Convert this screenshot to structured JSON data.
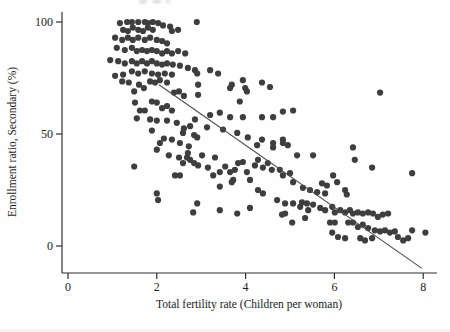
{
  "figure": {
    "background": "#fefefe",
    "top_edge_artifact": "faint-cropped-text-remnant"
  },
  "chart_data": {
    "type": "scatter",
    "title": "",
    "xlabel": "Total fertility rate (Children per woman)",
    "ylabel": "Enrollment ratio, Secondary (%)",
    "xlim": [
      0,
      8.3
    ],
    "ylim": [
      -12,
      104
    ],
    "xticks": [
      "0",
      "2",
      "4",
      "6",
      "8"
    ],
    "xtick_values": [
      0,
      2,
      4,
      6,
      8
    ],
    "yticks": [
      "0",
      "50",
      "100"
    ],
    "ytick_values": [
      0,
      50,
      100
    ],
    "grid": false,
    "legend": null,
    "point_color": "#3e3e3e",
    "axis_color": "#2f2f2f",
    "text_color": "#1c1c1c",
    "trend_line": {
      "x1": 2.05,
      "y1": 72,
      "x2": 7.97,
      "y2": -10,
      "color": "#4d4d4d",
      "slope": -14,
      "intercept": 100
    },
    "points": [
      [
        1.17,
        99.5
      ],
      [
        1.33,
        100
      ],
      [
        1.44,
        100
      ],
      [
        1.58,
        100
      ],
      [
        1.73,
        100
      ],
      [
        1.8,
        99.5
      ],
      [
        1.91,
        100
      ],
      [
        2.03,
        99.5
      ],
      [
        2.14,
        98.5
      ],
      [
        2.3,
        98
      ],
      [
        2.9,
        100
      ],
      [
        1.24,
        96.5
      ],
      [
        1.35,
        96
      ],
      [
        1.46,
        97.5
      ],
      [
        1.58,
        96.5
      ],
      [
        1.69,
        96
      ],
      [
        1.8,
        97.5
      ],
      [
        1.91,
        96.5
      ],
      [
        2.34,
        96
      ],
      [
        2.48,
        96.5
      ],
      [
        1.06,
        93
      ],
      [
        1.22,
        92
      ],
      [
        1.35,
        93
      ],
      [
        1.46,
        92
      ],
      [
        1.58,
        93
      ],
      [
        1.73,
        92
      ],
      [
        1.85,
        93
      ],
      [
        2.0,
        92
      ],
      [
        2.12,
        91.5
      ],
      [
        2.23,
        90.5
      ],
      [
        1.1,
        88.5
      ],
      [
        1.28,
        87.5
      ],
      [
        1.44,
        88.5
      ],
      [
        1.55,
        87
      ],
      [
        1.67,
        87.5
      ],
      [
        1.78,
        87
      ],
      [
        1.89,
        87.5
      ],
      [
        2.0,
        87
      ],
      [
        2.12,
        86
      ],
      [
        2.23,
        87
      ],
      [
        2.34,
        86
      ],
      [
        2.48,
        87
      ],
      [
        2.64,
        86
      ],
      [
        0.95,
        83
      ],
      [
        1.13,
        82.5
      ],
      [
        1.28,
        81.5
      ],
      [
        1.44,
        82.5
      ],
      [
        1.55,
        81.5
      ],
      [
        1.67,
        82.5
      ],
      [
        1.78,
        81.5
      ],
      [
        1.89,
        82.5
      ],
      [
        2.0,
        81.5
      ],
      [
        2.12,
        81
      ],
      [
        2.23,
        81.5
      ],
      [
        2.36,
        81
      ],
      [
        2.52,
        80.5
      ],
      [
        2.7,
        79.5
      ],
      [
        2.86,
        78.5
      ],
      [
        1.44,
        78
      ],
      [
        1.58,
        77
      ],
      [
        1.73,
        78
      ],
      [
        1.89,
        77
      ],
      [
        2.03,
        76.5
      ],
      [
        2.18,
        77
      ],
      [
        2.34,
        76.5
      ],
      [
        1.06,
        76
      ],
      [
        1.24,
        76.5
      ],
      [
        2.91,
        77
      ],
      [
        3.38,
        77
      ],
      [
        3.69,
        72
      ],
      [
        3.94,
        74
      ],
      [
        3.99,
        70.5
      ],
      [
        2.93,
        72
      ],
      [
        2.93,
        67.5
      ],
      [
        3.87,
        64.5
      ],
      [
        3.2,
        78.5
      ],
      [
        3.65,
        70.5
      ],
      [
        4.03,
        69
      ],
      [
        4.37,
        73
      ],
      [
        4.55,
        71
      ],
      [
        5.07,
        60.5
      ],
      [
        7.03,
        68.5
      ],
      [
        1.22,
        73.5
      ],
      [
        1.37,
        73
      ],
      [
        1.49,
        69
      ],
      [
        1.6,
        72
      ],
      [
        1.71,
        70.5
      ],
      [
        1.85,
        73.5
      ],
      [
        1.96,
        73
      ],
      [
        2.07,
        74
      ],
      [
        2.23,
        73
      ],
      [
        2.39,
        68.5
      ],
      [
        2.5,
        69
      ],
      [
        2.61,
        67
      ],
      [
        1.51,
        64
      ],
      [
        1.62,
        60.5
      ],
      [
        1.73,
        60.5
      ],
      [
        1.89,
        64.5
      ],
      [
        2.0,
        64
      ],
      [
        2.12,
        61.5
      ],
      [
        2.23,
        62.5
      ],
      [
        2.34,
        60.5
      ],
      [
        1.55,
        57
      ],
      [
        1.85,
        56.5
      ],
      [
        2.0,
        56
      ],
      [
        2.23,
        56
      ],
      [
        2.45,
        55
      ],
      [
        2.61,
        52.5
      ],
      [
        2.75,
        53.5
      ],
      [
        1.89,
        51.5
      ],
      [
        2.16,
        48
      ],
      [
        2.34,
        47.5
      ],
      [
        2.52,
        46
      ],
      [
        2.72,
        44.5
      ],
      [
        2.84,
        49.5
      ],
      [
        2.0,
        43
      ],
      [
        2.27,
        40.5
      ],
      [
        2.5,
        39.5
      ],
      [
        1.49,
        35.5
      ],
      [
        2.41,
        31.5
      ],
      [
        2.68,
        39.5
      ],
      [
        2.84,
        37
      ],
      [
        4.84,
        60
      ],
      [
        4.62,
        57.5
      ],
      [
        4.37,
        57.5
      ],
      [
        3.94,
        57.5
      ],
      [
        3.65,
        57.5
      ],
      [
        3.42,
        59.5
      ],
      [
        3.2,
        58.5
      ],
      [
        2.86,
        56.5
      ],
      [
        3.13,
        53
      ],
      [
        3.49,
        52
      ],
      [
        3.81,
        50.5
      ],
      [
        4.05,
        48.5
      ],
      [
        4.37,
        47.5
      ],
      [
        4.62,
        46
      ],
      [
        4.84,
        47.5
      ],
      [
        2.91,
        48.5
      ],
      [
        2.59,
        50.5
      ],
      [
        2.07,
        46
      ],
      [
        2.7,
        41.5
      ],
      [
        3.02,
        40.5
      ],
      [
        3.31,
        39.5
      ],
      [
        4.26,
        45
      ],
      [
        4.62,
        44
      ],
      [
        4.84,
        46
      ],
      [
        4.95,
        45
      ],
      [
        5.16,
        40.5
      ],
      [
        6.42,
        44
      ],
      [
        2.59,
        37
      ],
      [
        2.75,
        38.5
      ],
      [
        2.93,
        36
      ],
      [
        3.15,
        35
      ],
      [
        3.27,
        31.5
      ],
      [
        3.42,
        33
      ],
      [
        3.54,
        35.5
      ],
      [
        3.65,
        33
      ],
      [
        3.72,
        29.5
      ],
      [
        3.76,
        34
      ],
      [
        3.83,
        37
      ],
      [
        3.94,
        37.5
      ],
      [
        4.03,
        33
      ],
      [
        4.1,
        29.5
      ],
      [
        4.21,
        36
      ],
      [
        4.28,
        38.5
      ],
      [
        4.39,
        35
      ],
      [
        4.5,
        37
      ],
      [
        4.59,
        34
      ],
      [
        4.77,
        34
      ],
      [
        4.84,
        31.5
      ],
      [
        5.0,
        32.5
      ],
      [
        5.07,
        28.5
      ],
      [
        2.52,
        31.5
      ],
      [
        3.42,
        26.5
      ],
      [
        3.69,
        28.5
      ],
      [
        4.28,
        25
      ],
      [
        4.39,
        23.5
      ],
      [
        4.71,
        20.5
      ],
      [
        4.89,
        19
      ],
      [
        4.89,
        14.5
      ],
      [
        5.07,
        19
      ],
      [
        2.0,
        23.5
      ],
      [
        2.03,
        20.5
      ],
      [
        2.91,
        19
      ],
      [
        2.82,
        15
      ],
      [
        3.42,
        16
      ],
      [
        3.81,
        14.5
      ],
      [
        4.1,
        17
      ],
      [
        4.82,
        14
      ],
      [
        5.05,
        10.5
      ],
      [
        5.52,
        40.5
      ],
      [
        6.46,
        38.5
      ],
      [
        6.85,
        35
      ],
      [
        7.75,
        32.5
      ],
      [
        5.97,
        31.5
      ],
      [
        6.06,
        28.5
      ],
      [
        5.72,
        28
      ],
      [
        5.83,
        27
      ],
      [
        5.29,
        26
      ],
      [
        5.45,
        25
      ],
      [
        5.61,
        24
      ],
      [
        5.79,
        23.5
      ],
      [
        6.24,
        25
      ],
      [
        6.28,
        23
      ],
      [
        5.27,
        19.5
      ],
      [
        5.38,
        19
      ],
      [
        5.52,
        18.5
      ],
      [
        5.23,
        17.5
      ],
      [
        5.41,
        16
      ],
      [
        5.68,
        17
      ],
      [
        5.79,
        16
      ],
      [
        5.95,
        17.5
      ],
      [
        6.01,
        15
      ],
      [
        6.13,
        16
      ],
      [
        6.24,
        15
      ],
      [
        6.35,
        16
      ],
      [
        6.42,
        14.5
      ],
      [
        6.53,
        15
      ],
      [
        6.64,
        14.5
      ],
      [
        6.76,
        15
      ],
      [
        6.87,
        14.5
      ],
      [
        6.98,
        13
      ],
      [
        7.09,
        14
      ],
      [
        7.21,
        14.5
      ],
      [
        5.34,
        12.5
      ],
      [
        5.9,
        10.5
      ],
      [
        6.01,
        10.5
      ],
      [
        6.31,
        10.5
      ],
      [
        6.42,
        10.5
      ],
      [
        6.53,
        8.5
      ],
      [
        6.64,
        9.5
      ],
      [
        6.76,
        8
      ],
      [
        6.91,
        7
      ],
      [
        7.03,
        6.5
      ],
      [
        7.14,
        7
      ],
      [
        7.25,
        6
      ],
      [
        7.36,
        6.5
      ],
      [
        5.95,
        6
      ],
      [
        6.08,
        4
      ],
      [
        6.24,
        3.5
      ],
      [
        6.58,
        3.5
      ],
      [
        6.69,
        2.5
      ],
      [
        6.85,
        3.5
      ],
      [
        7.43,
        4
      ],
      [
        7.55,
        2.5
      ],
      [
        7.66,
        3.5
      ],
      [
        7.75,
        7
      ],
      [
        8.05,
        6
      ]
    ]
  }
}
